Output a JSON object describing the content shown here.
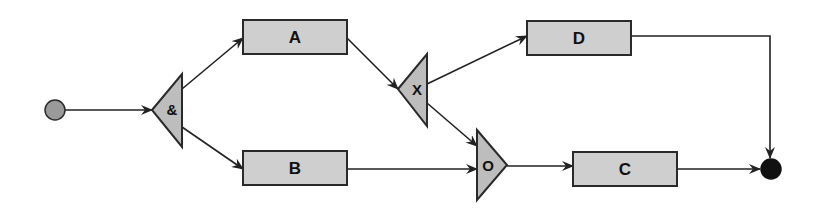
{
  "diagram": {
    "type": "process-flow",
    "start_event": {
      "id": "start",
      "label": "",
      "fill": "#9a9a9a"
    },
    "end_event": {
      "id": "end",
      "label": "",
      "fill": "#111111"
    },
    "gateways": [
      {
        "id": "and_split",
        "label": "&",
        "kind": "AND split"
      },
      {
        "id": "xor_split",
        "label": "X",
        "kind": "XOR split"
      },
      {
        "id": "or_join",
        "label": "O",
        "kind": "OR join"
      }
    ],
    "tasks": [
      {
        "id": "A",
        "label": "A"
      },
      {
        "id": "B",
        "label": "B"
      },
      {
        "id": "C",
        "label": "C"
      },
      {
        "id": "D",
        "label": "D"
      }
    ],
    "edges": [
      {
        "from": "start",
        "to": "and_split"
      },
      {
        "from": "and_split",
        "to": "A"
      },
      {
        "from": "and_split",
        "to": "B"
      },
      {
        "from": "A",
        "to": "xor_split"
      },
      {
        "from": "xor_split",
        "to": "D"
      },
      {
        "from": "xor_split",
        "to": "or_join"
      },
      {
        "from": "B",
        "to": "or_join"
      },
      {
        "from": "or_join",
        "to": "C"
      },
      {
        "from": "C",
        "to": "end"
      },
      {
        "from": "D",
        "to": "end"
      }
    ],
    "colors": {
      "task_fill": "#cfcfcf",
      "gateway_fill": "#bdbdbd",
      "stroke": "#2a2a2a"
    }
  }
}
